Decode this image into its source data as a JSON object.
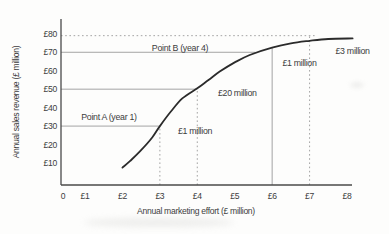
{
  "chart_data": {
    "type": "line",
    "title": "",
    "xlabel": "Annual marketing effort (£ million)",
    "ylabel": "Annual sales revenue (£ million)",
    "xlim": [
      0,
      8.3
    ],
    "ylim": [
      0,
      85
    ],
    "grid": "reference-lines-only",
    "legend": "none",
    "x_ticks": [
      {
        "label": "0",
        "value": 0
      },
      {
        "label": "£1",
        "value": 1
      },
      {
        "label": "£2",
        "value": 2
      },
      {
        "label": "£3",
        "value": 3
      },
      {
        "label": "£4",
        "value": 4
      },
      {
        "label": "£5",
        "value": 5
      },
      {
        "label": "£6",
        "value": 6
      },
      {
        "label": "£7",
        "value": 7
      },
      {
        "label": "£8",
        "value": 8
      }
    ],
    "y_ticks": [
      {
        "label": "£80",
        "value": 80
      },
      {
        "label": "£70",
        "value": 70
      },
      {
        "label": "£60",
        "value": 60
      },
      {
        "label": "£50",
        "value": 50
      },
      {
        "label": "£40",
        "value": 40
      },
      {
        "label": "£30",
        "value": 30
      },
      {
        "label": "£20",
        "value": 20
      },
      {
        "label": "£10",
        "value": 10
      }
    ],
    "series": [
      {
        "name": "sales-response-curve",
        "points": [
          [
            2.0,
            7.5
          ],
          [
            2.2,
            11
          ],
          [
            2.5,
            17
          ],
          [
            2.8,
            24
          ],
          [
            3.0,
            30
          ],
          [
            3.3,
            38
          ],
          [
            3.6,
            45
          ],
          [
            4.0,
            50.5
          ],
          [
            4.3,
            55
          ],
          [
            4.6,
            59.5
          ],
          [
            5.0,
            64.5
          ],
          [
            5.4,
            68.5
          ],
          [
            6.0,
            72.5
          ],
          [
            6.5,
            74.8
          ],
          [
            7.0,
            76.2
          ],
          [
            7.5,
            77.2
          ],
          [
            8.15,
            77.5
          ]
        ]
      }
    ],
    "reference_lines": [
      {
        "axis": "y",
        "value": 79,
        "from": 0,
        "to": 7.15,
        "style": "dotted"
      },
      {
        "axis": "y",
        "value": 70,
        "from": 0,
        "to": 5.55,
        "style": "solid"
      },
      {
        "axis": "y",
        "value": 50,
        "from": 0,
        "to": 4,
        "style": "solid"
      },
      {
        "axis": "y",
        "value": 30,
        "from": 0,
        "to": 3,
        "style": "solid"
      },
      {
        "axis": "x",
        "value": 3,
        "from": 0,
        "to": 30,
        "style": "dotted"
      },
      {
        "axis": "x",
        "value": 4,
        "from": 0,
        "to": 50,
        "style": "dotted"
      },
      {
        "axis": "x",
        "value": 6,
        "from": 0,
        "to": 72.5,
        "style": "solid"
      },
      {
        "axis": "x",
        "value": 7,
        "from": 0,
        "to": 79,
        "style": "dotted"
      }
    ],
    "annotations": [
      {
        "id": "point-b",
        "text": "Point B (year 4)",
        "x": 4.29,
        "y": 72.5,
        "align": "end"
      },
      {
        "id": "point-a",
        "text": "Point A (year 1)",
        "x": 1.64,
        "y": 35,
        "align": "middle"
      },
      {
        "id": "increment-1m-low",
        "text": "£1 million",
        "x": 3.94,
        "y": 27.5,
        "align": "middle"
      },
      {
        "id": "increment-20m",
        "text": "£20 million",
        "x": 5.07,
        "y": 48,
        "align": "middle"
      },
      {
        "id": "increment-1m-high",
        "text": "£1 million",
        "x": 6.73,
        "y": 64,
        "align": "middle"
      },
      {
        "id": "increment-3m",
        "text": "£3 million",
        "x": 8.15,
        "y": 70.5,
        "align": "middle"
      }
    ],
    "colors": {
      "curve": "#2b2b2b",
      "axis": "#4a4a4a",
      "reference_line": "#9a9a9a",
      "text": "#3c3c3c",
      "background": "#fdfdfc"
    }
  }
}
